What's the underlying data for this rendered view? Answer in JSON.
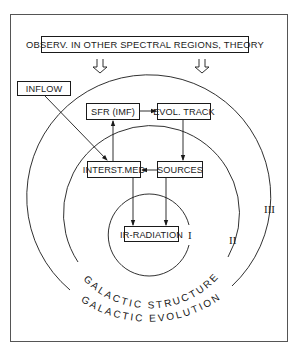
{
  "diagram": {
    "type": "nested-circles-flowchart",
    "colors": {
      "ink": "#1a1a1a",
      "background": "#ffffff",
      "frame": "#555555"
    },
    "header_box": {
      "label": "OBSERV. IN OTHER SPECTRAL REGIONS, THEORY"
    },
    "boxes": {
      "inflow": {
        "label": "INFLOW"
      },
      "sfr": {
        "label": "SFR (IMF)"
      },
      "evol_track": {
        "label": "EVOL. TRACK"
      },
      "interst_med": {
        "label": "INTERST.MED"
      },
      "sources": {
        "label": "SOURCES"
      },
      "ir_radiation": {
        "label": "IR-RADIATION"
      }
    },
    "circles": [
      {
        "id": "I",
        "numeral": "I"
      },
      {
        "id": "II",
        "numeral": "II",
        "arc_label": "GALACTIC STRUCTURE"
      },
      {
        "id": "III",
        "numeral": "III",
        "arc_label": "GALACTIC EVOLUTION"
      }
    ],
    "edges": [
      {
        "from": "OBSERV. IN OTHER SPECTRAL REGIONS, THEORY",
        "to": "circles",
        "style": "open-arrow",
        "count": 2
      },
      {
        "from": "INFLOW",
        "to": "INTERST.MED"
      },
      {
        "from": "INTERST.MED",
        "to": "SFR (IMF)"
      },
      {
        "from": "SFR (IMF)",
        "to": "EVOL. TRACK"
      },
      {
        "from": "EVOL. TRACK",
        "to": "SOURCES"
      },
      {
        "from": "SOURCES",
        "to": "INTERST.MED"
      },
      {
        "from": "INTERST.MED",
        "to": "IR-RADIATION"
      },
      {
        "from": "SOURCES",
        "to": "IR-RADIATION"
      }
    ]
  }
}
